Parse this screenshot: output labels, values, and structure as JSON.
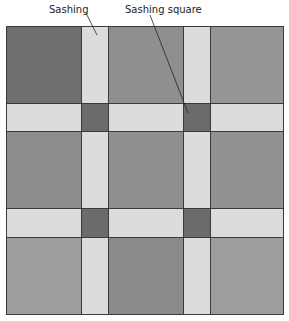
{
  "labels": {
    "sashing": "Sashing",
    "sashing_square": "Sashing square"
  },
  "colors": {
    "sashing": "#dcdcdc",
    "sashing_square": "#6b6b6b",
    "outline": "#3a3a3a"
  },
  "grid": {
    "blocks": [
      {
        "row": 0,
        "col": 0,
        "color": "#6f6f6f"
      },
      {
        "row": 0,
        "col": 1,
        "color": "#8f8f8f"
      },
      {
        "row": 0,
        "col": 2,
        "color": "#969696"
      },
      {
        "row": 1,
        "col": 0,
        "color": "#8d8d8d"
      },
      {
        "row": 1,
        "col": 1,
        "color": "#8f8f8f"
      },
      {
        "row": 1,
        "col": 2,
        "color": "#929292"
      },
      {
        "row": 2,
        "col": 0,
        "color": "#9e9e9e"
      },
      {
        "row": 2,
        "col": 1,
        "color": "#8b8b8b"
      },
      {
        "row": 2,
        "col": 2,
        "color": "#9d9d9d"
      }
    ]
  }
}
